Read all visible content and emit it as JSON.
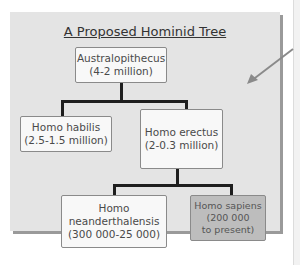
{
  "diagram": {
    "title": "A Proposed Hominid Tree",
    "nodes": [
      {
        "id": "australopithecus",
        "name": "Australopithecus",
        "range": "(4-2 million)"
      },
      {
        "id": "homo-habilis",
        "name": "Homo habilis",
        "range": "(2.5-1.5 million)"
      },
      {
        "id": "homo-erectus",
        "name": "Homo erectus",
        "range": "(2-0.3 million)"
      },
      {
        "id": "homo-neanderthalensis",
        "name_line1": "Homo",
        "name_line2": "neanderthalensis",
        "range": "(300 000-25 000)"
      },
      {
        "id": "homo-sapiens",
        "name": "Homo sapiens",
        "range_line1": "(200 000",
        "range_line2": "to present)",
        "highlighted": true
      }
    ],
    "edges": [
      [
        "australopithecus",
        "homo-habilis"
      ],
      [
        "australopithecus",
        "homo-erectus"
      ],
      [
        "homo-erectus",
        "homo-neanderthalensis"
      ],
      [
        "homo-erectus",
        "homo-sapiens"
      ]
    ],
    "colors": {
      "panel": "#e4e4e4",
      "box": "#f8f8f8",
      "highlight_box": "#bdbdbd",
      "lines": "#1e1e1e"
    }
  }
}
